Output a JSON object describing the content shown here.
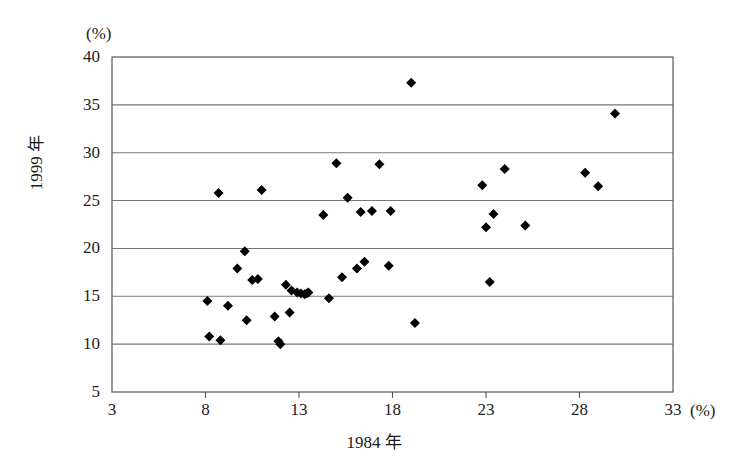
{
  "chart_data": {
    "type": "scatter",
    "title": "",
    "xlabel": "1984 年",
    "ylabel": "1999 年",
    "x_unit": "(%)",
    "y_unit": "(%)",
    "xlim": [
      3,
      33
    ],
    "ylim": [
      5,
      40
    ],
    "x_ticks": [
      3,
      8,
      13,
      18,
      23,
      28,
      33
    ],
    "y_ticks": [
      5,
      10,
      15,
      20,
      25,
      30,
      35,
      40
    ],
    "x_tick_labels": [
      "3",
      "8",
      "13",
      "18",
      "23",
      "28",
      "33"
    ],
    "y_tick_labels": [
      "5",
      "10",
      "15",
      "20",
      "25",
      "30",
      "35",
      "40"
    ],
    "grid": "horizontal",
    "legend": "none",
    "marker": "diamond",
    "marker_color": "#000000",
    "points": [
      [
        8.1,
        14.5
      ],
      [
        8.2,
        10.8
      ],
      [
        8.7,
        25.8
      ],
      [
        8.8,
        10.4
      ],
      [
        9.2,
        14.0
      ],
      [
        9.7,
        17.9
      ],
      [
        10.1,
        19.7
      ],
      [
        10.2,
        12.5
      ],
      [
        10.5,
        16.7
      ],
      [
        10.8,
        16.8
      ],
      [
        11.0,
        26.1
      ],
      [
        11.7,
        12.9
      ],
      [
        11.9,
        10.3
      ],
      [
        12.0,
        10.0
      ],
      [
        12.3,
        16.2
      ],
      [
        12.5,
        13.3
      ],
      [
        12.6,
        15.6
      ],
      [
        12.9,
        15.4
      ],
      [
        13.1,
        15.3
      ],
      [
        13.3,
        15.2
      ],
      [
        13.4,
        15.3
      ],
      [
        13.5,
        15.4
      ],
      [
        14.3,
        23.5
      ],
      [
        14.6,
        14.8
      ],
      [
        15.0,
        28.9
      ],
      [
        15.3,
        17.0
      ],
      [
        15.6,
        25.3
      ],
      [
        16.1,
        17.9
      ],
      [
        16.3,
        23.8
      ],
      [
        16.5,
        18.6
      ],
      [
        16.9,
        23.9
      ],
      [
        17.3,
        28.8
      ],
      [
        17.8,
        18.2
      ],
      [
        17.9,
        23.9
      ],
      [
        19.0,
        37.3
      ],
      [
        19.2,
        12.2
      ],
      [
        22.8,
        26.6
      ],
      [
        23.0,
        22.2
      ],
      [
        23.2,
        16.5
      ],
      [
        23.4,
        23.6
      ],
      [
        24.0,
        28.3
      ],
      [
        25.1,
        22.4
      ],
      [
        28.3,
        27.9
      ],
      [
        29.0,
        26.5
      ],
      [
        29.9,
        34.1
      ]
    ]
  },
  "axes_geometry": {
    "plot_left": 112,
    "plot_right": 673,
    "plot_top": 57,
    "plot_bottom": 392
  }
}
